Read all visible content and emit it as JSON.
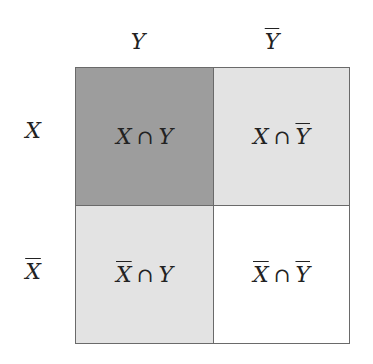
{
  "column_headers": [
    {
      "var": "Y",
      "complement": false
    },
    {
      "var": "Y",
      "complement": true
    }
  ],
  "row_headers": [
    {
      "var": "X",
      "complement": false
    },
    {
      "var": "X",
      "complement": true
    }
  ],
  "operator": "∩",
  "labels": {
    "col_y": "Y",
    "col_ybar": "Y",
    "row_x": "X",
    "row_xbar": "X"
  },
  "cells": [
    {
      "left": "X",
      "left_bar": false,
      "right": "Y",
      "right_bar": false,
      "fill": "#9d9d9d",
      "text": "X ∩ Y"
    },
    {
      "left": "X",
      "left_bar": false,
      "right": "Y",
      "right_bar": true,
      "fill": "#e3e3e3",
      "text": "X ∩ Ȳ"
    },
    {
      "left": "X",
      "left_bar": true,
      "right": "Y",
      "right_bar": false,
      "fill": "#e3e3e3",
      "text": "X̄ ∩ Y"
    },
    {
      "left": "X",
      "left_bar": true,
      "right": "Y",
      "right_bar": true,
      "fill": "#ffffff",
      "text": "X̄ ∩ Ȳ"
    }
  ],
  "colors": {
    "border": "#6a6a6a",
    "dark_fill": "#9d9d9d",
    "light_fill": "#e3e3e3",
    "empty_fill": "#ffffff"
  }
}
